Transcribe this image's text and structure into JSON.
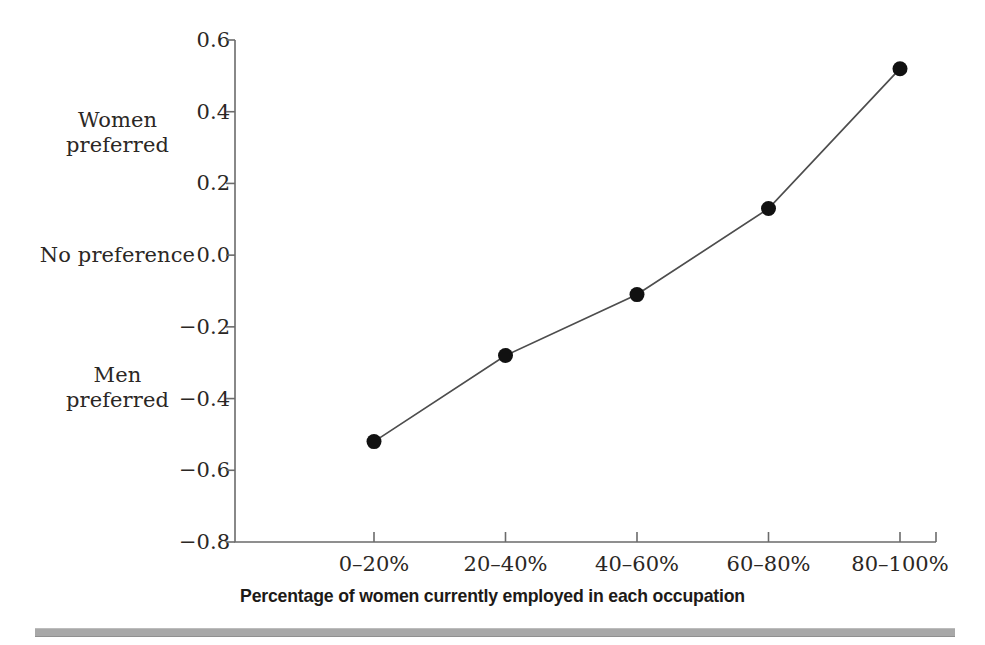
{
  "chart_data": {
    "type": "line",
    "title": "",
    "xlabel": "Percentage of women currently employed in each occupation",
    "ylabel": "",
    "categories": [
      "0–20%",
      "20–40%",
      "40–60%",
      "60–80%",
      "80–100%"
    ],
    "values": [
      -0.52,
      -0.28,
      -0.11,
      0.13,
      0.52
    ],
    "series": [
      {
        "name": "Gender preference",
        "values": [
          -0.52,
          -0.28,
          -0.11,
          0.13,
          0.52
        ]
      }
    ],
    "ylim": [
      -0.8,
      0.6
    ],
    "ytick_labels": [
      "0.6",
      "0.4",
      "0.2",
      "0.0",
      "−0.2",
      "−0.4",
      "−0.6",
      "−0.8"
    ],
    "ytick_values": [
      0.6,
      0.4,
      0.2,
      0.0,
      -0.2,
      -0.4,
      -0.6,
      -0.8
    ],
    "xtick_labels": [
      "0–20%",
      "20–40%",
      "40–60%",
      "60–80%",
      "80–100%"
    ],
    "grid": false,
    "legend": "none",
    "annotations": [
      {
        "text": "Women\npreferred",
        "axis": "y",
        "at": 0.4
      },
      {
        "text": "No preference",
        "axis": "y",
        "at": 0.0
      },
      {
        "text": "Men\npreferred",
        "axis": "y",
        "at": -0.4
      }
    ],
    "marker": "filled-circle",
    "colors": {
      "line": "#4d4d4d",
      "marker": "#111111",
      "axis": "#6b6b6b",
      "text": "#2b2724",
      "rule": "#a8a8a8"
    }
  },
  "annotations": {
    "women_preferred": "Women\npreferred",
    "no_preference": "No preference",
    "men_preferred": "Men\npreferred"
  },
  "axis": {
    "x_title": "Percentage of women currently employed in each occupation",
    "y_ticks": [
      "0.6",
      "0.4",
      "0.2",
      "0.0",
      "−0.2",
      "−0.4",
      "−0.6",
      "−0.8"
    ],
    "x_ticks": [
      "0–20%",
      "20–40%",
      "40–60%",
      "60–80%",
      "80–100%"
    ]
  }
}
